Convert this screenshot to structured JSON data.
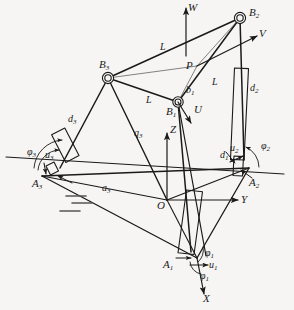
{
  "figure": {
    "type": "kinematic-diagram",
    "background_color": "#f6f5f3",
    "line_color": "#1a1a1a"
  },
  "labels": {
    "W": "W",
    "V": "V",
    "U": "U",
    "X": "X",
    "Y": "Y",
    "Z": "Z",
    "P": "P",
    "O": "O",
    "B1": "B",
    "B1sub": "1",
    "B2": "B",
    "B2sub": "2",
    "B3": "B",
    "B3sub": "3",
    "A1": "A",
    "A1sub": "1",
    "A2": "A",
    "A2sub": "2",
    "A3": "A",
    "A3sub": "3",
    "L_top": "L",
    "L_mid": "L",
    "L_right": "L",
    "b1": "b",
    "b1sub": "1",
    "d1": "d",
    "d1sub": "1",
    "d2": "d",
    "d2sub": "2",
    "d3": "d",
    "d3sub": "3",
    "q3": "q",
    "q3sub": "3",
    "a3": "a",
    "a3sub": "3",
    "u1": "u",
    "u1sub": "1",
    "u2": "u",
    "u2sub": "2",
    "u3": "u",
    "u3sub": "3",
    "phi1a": "φ",
    "phi1asub": "1",
    "phi1b": "φ",
    "phi1bsub": "1",
    "phi2": "φ",
    "phi2sub": "2",
    "phi3": "φ",
    "phi3sub": "3"
  },
  "points": {
    "B1": [
      178,
      102
    ],
    "B2": [
      240,
      18
    ],
    "B3": [
      108,
      78
    ],
    "A1": [
      197,
      258
    ],
    "A2": [
      249,
      168
    ],
    "A3": [
      42,
      176
    ],
    "O": [
      167,
      200
    ],
    "P": [
      197,
      66
    ]
  }
}
